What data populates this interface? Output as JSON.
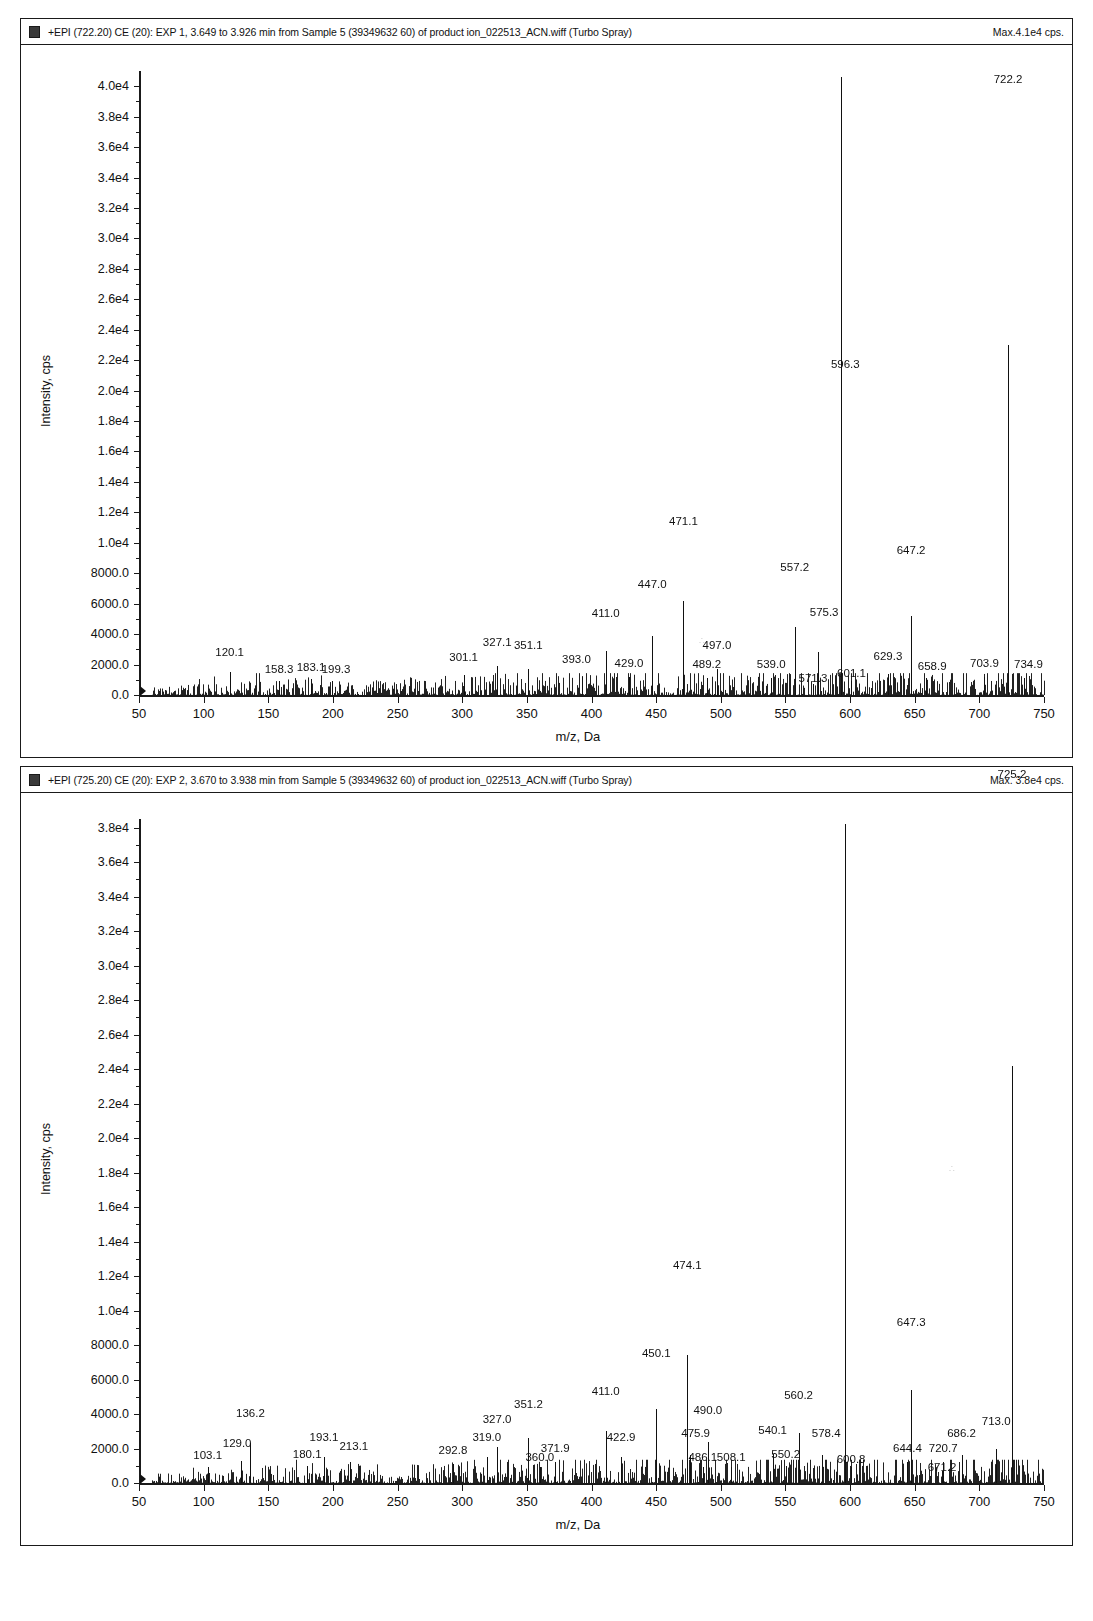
{
  "panels": [
    {
      "id": "top",
      "header": {
        "title": "+EPI (722.20) CE (20): EXP 1, 3.649 to 3.926 min from Sample 5 (39349632 60) of product ion_022513_ACN.wiff (Turbo Spray)",
        "max_label": "Max.4.1e4 cps."
      },
      "chart_data": {
        "type": "line",
        "title": "+EPI (722.20) CE (20): EXP 1, 3.649 to 3.926 min from Sample 5 (39349632 60) of product ion_022513_ACN.wiff (Turbo Spray)",
        "xlabel": "m/z, Da",
        "ylabel": "Intensity, cps",
        "xlim": [
          50,
          750
        ],
        "ylim": [
          0,
          41000
        ],
        "grid": false,
        "legend": "none",
        "xticks": [
          50,
          100,
          150,
          200,
          250,
          300,
          350,
          400,
          450,
          500,
          550,
          600,
          650,
          700,
          750
        ],
        "yticks": [
          0,
          2000,
          4000,
          6000,
          8000,
          10000,
          12000,
          14000,
          16000,
          18000,
          20000,
          22000,
          24000,
          26000,
          28000,
          30000,
          32000,
          34000,
          36000,
          38000,
          40000
        ],
        "ytick_labels": [
          "0.0",
          "2000.0",
          "4000.0",
          "6000.0",
          "8000.0",
          "1.0e4",
          "1.2e4",
          "1.4e4",
          "1.6e4",
          "1.8e4",
          "2.0e4",
          "2.2e4",
          "2.4e4",
          "2.6e4",
          "2.8e4",
          "3.0e4",
          "3.2e4",
          "3.4e4",
          "3.6e4",
          "3.8e4",
          "4.0e4"
        ],
        "peaks": [
          {
            "mz": 120.1,
            "intensity": 1500,
            "label": "120.1",
            "label_dx": 0,
            "label_dy": -12
          },
          {
            "mz": 158.3,
            "intensity": 900,
            "label": "158.3",
            "label_dx": 0,
            "label_dy": -4
          },
          {
            "mz": 183.1,
            "intensity": 1050,
            "label": "183.1",
            "label_dx": 0,
            "label_dy": -4
          },
          {
            "mz": 199.3,
            "intensity": 900,
            "label": "199.3",
            "label_dx": 4,
            "label_dy": -4
          },
          {
            "mz": 301.1,
            "intensity": 1300,
            "label": "301.1",
            "label_dx": 0,
            "label_dy": -10
          },
          {
            "mz": 327.1,
            "intensity": 1900,
            "label": "327.1",
            "label_dx": 0,
            "label_dy": -16
          },
          {
            "mz": 351.1,
            "intensity": 1700,
            "label": "351.1",
            "label_dx": 0,
            "label_dy": -16
          },
          {
            "mz": 393.0,
            "intensity": 1200,
            "label": "393.0",
            "label_dx": -6,
            "label_dy": -10
          },
          {
            "mz": 411.0,
            "intensity": 2900,
            "label": "411.0",
            "label_dx": 0,
            "label_dy": -30
          },
          {
            "mz": 429.0,
            "intensity": 1150,
            "label": "429.0",
            "label_dx": 0,
            "label_dy": -6
          },
          {
            "mz": 447.0,
            "intensity": 3900,
            "label": "447.0",
            "label_dx": 0,
            "label_dy": -44
          },
          {
            "mz": 471.1,
            "intensity": 6200,
            "label": "471.1",
            "label_dx": 0,
            "label_dy": -72
          },
          {
            "mz": 489.2,
            "intensity": 1100,
            "label": "489.2",
            "label_dx": 0,
            "label_dy": -6
          },
          {
            "mz": 497.0,
            "intensity": 1700,
            "label": "497.0",
            "label_dx": 0,
            "label_dy": -16
          },
          {
            "mz": 539.0,
            "intensity": 1100,
            "label": "539.0",
            "label_dx": 0,
            "label_dy": -6
          },
          {
            "mz": 557.2,
            "intensity": 4500,
            "label": "557.2",
            "label_dx": 0,
            "label_dy": -52
          },
          {
            "mz": 571.3,
            "intensity": 700,
            "label": "571.3",
            "label_dx": 0,
            "label_dy": 2
          },
          {
            "mz": 575.3,
            "intensity": 2800,
            "label": "575.3",
            "label_dx": 6,
            "label_dy": -32
          },
          {
            "mz": 593.2,
            "intensity": 40600,
            "label": "593.2",
            "label_dx": 0,
            "label_dy": -466
          },
          {
            "mz": 601.1,
            "intensity": 900,
            "label": "601.1",
            "label_dx": 0,
            "label_dy": 0
          },
          {
            "mz": 629.3,
            "intensity": 1400,
            "label": "629.3",
            "label_dx": 0,
            "label_dy": -10
          },
          {
            "mz": 647.2,
            "intensity": 5200,
            "label": "647.2",
            "label_dx": 0,
            "label_dy": -58
          },
          {
            "mz": 658.9,
            "intensity": 1100,
            "label": "658.9",
            "label_dx": 6,
            "label_dy": -4
          },
          {
            "mz": 703.9,
            "intensity": 1200,
            "label": "703.9",
            "label_dx": 0,
            "label_dy": -6
          },
          {
            "mz": 722.2,
            "intensity": 23000,
            "label": "722.2",
            "label_dx": 0,
            "label_dy": -258
          },
          {
            "mz": 734.9,
            "intensity": 1100,
            "label": "734.9",
            "label_dx": 4,
            "label_dy": -6
          }
        ]
      }
    },
    {
      "id": "bottom",
      "header": {
        "title": "+EPI (725.20) CE (20): EXP 2, 3.670 to 3.938 min from Sample 5 (39349632 60) of product ion_022513_ACN.wiff (Turbo Spray)",
        "max_label": "Max. 3.8e4 cps."
      },
      "chart_data": {
        "type": "line",
        "title": "+EPI (725.20) CE (20): EXP 2, 3.670 to 3.938 min from Sample 5 (39349632 60) of product ion_022513_ACN.wiff (Turbo Spray)",
        "xlabel": "m/z, Da",
        "ylabel": "Intensity, cps",
        "xlim": [
          50,
          750
        ],
        "ylim": [
          0,
          38500
        ],
        "grid": false,
        "legend": "none",
        "xticks": [
          50,
          100,
          150,
          200,
          250,
          300,
          350,
          400,
          450,
          500,
          550,
          600,
          650,
          700,
          750
        ],
        "yticks": [
          0,
          2000,
          4000,
          6000,
          8000,
          10000,
          12000,
          14000,
          16000,
          18000,
          20000,
          22000,
          24000,
          26000,
          28000,
          30000,
          32000,
          34000,
          36000,
          38000
        ],
        "ytick_labels": [
          "0.0",
          "2000.0",
          "4000.0",
          "6000.0",
          "8000.0",
          "1.0e4",
          "1.2e4",
          "1.4e4",
          "1.6e4",
          "1.8e4",
          "2.0e4",
          "2.2e4",
          "2.4e4",
          "2.6e4",
          "2.8e4",
          "3.0e4",
          "3.2e4",
          "3.4e4",
          "3.6e4",
          "3.8e4"
        ],
        "peaks": [
          {
            "mz": 103.1,
            "intensity": 900,
            "label": "103.1",
            "label_dx": 0,
            "label_dy": -4
          },
          {
            "mz": 129.0,
            "intensity": 1300,
            "label": "129.0",
            "label_dx": -4,
            "label_dy": -10
          },
          {
            "mz": 136.2,
            "intensity": 2300,
            "label": "136.2",
            "label_dx": 0,
            "label_dy": -22
          },
          {
            "mz": 180.1,
            "intensity": 1000,
            "label": "180.1",
            "label_dx": 0,
            "label_dy": -4
          },
          {
            "mz": 193.1,
            "intensity": 1500,
            "label": "193.1",
            "label_dx": 0,
            "label_dy": -12
          },
          {
            "mz": 213.1,
            "intensity": 1200,
            "label": "213.1",
            "label_dx": 4,
            "label_dy": -8
          },
          {
            "mz": 292.8,
            "intensity": 1100,
            "label": "292.8",
            "label_dx": 0,
            "label_dy": -6
          },
          {
            "mz": 319.0,
            "intensity": 1500,
            "label": "319.0",
            "label_dx": 0,
            "label_dy": -12
          },
          {
            "mz": 327.0,
            "intensity": 2100,
            "label": "327.0",
            "label_dx": 0,
            "label_dy": -20
          },
          {
            "mz": 351.2,
            "intensity": 2600,
            "label": "351.2",
            "label_dx": 0,
            "label_dy": -26
          },
          {
            "mz": 360.0,
            "intensity": 900,
            "label": "360.0",
            "label_dx": 0,
            "label_dy": -2
          },
          {
            "mz": 371.9,
            "intensity": 1200,
            "label": "371.9",
            "label_dx": 0,
            "label_dy": -6
          },
          {
            "mz": 411.0,
            "intensity": 3000,
            "label": "411.0",
            "label_dx": 0,
            "label_dy": -32
          },
          {
            "mz": 422.9,
            "intensity": 1500,
            "label": "422.9",
            "label_dx": 0,
            "label_dy": -12
          },
          {
            "mz": 450.1,
            "intensity": 4300,
            "label": "450.1",
            "label_dx": 0,
            "label_dy": -48
          },
          {
            "mz": 474.1,
            "intensity": 7400,
            "label": "474.1",
            "label_dx": 0,
            "label_dy": -82
          },
          {
            "mz": 475.9,
            "intensity": 1600,
            "label": "475.9",
            "label_dx": 6,
            "label_dy": -14
          },
          {
            "mz": 486.1,
            "intensity": 900,
            "label": "486.1",
            "label_dx": 0,
            "label_dy": -2
          },
          {
            "mz": 490.0,
            "intensity": 2400,
            "label": "490.0",
            "label_dx": 0,
            "label_dy": -24
          },
          {
            "mz": 508.1,
            "intensity": 900,
            "label": "508.1",
            "label_dx": 0,
            "label_dy": -2
          },
          {
            "mz": 540.1,
            "intensity": 1700,
            "label": "540.1",
            "label_dx": 0,
            "label_dy": -16
          },
          {
            "mz": 550.2,
            "intensity": 1000,
            "label": "550.2",
            "label_dx": 0,
            "label_dy": -4
          },
          {
            "mz": 560.2,
            "intensity": 2900,
            "label": "560.2",
            "label_dx": 0,
            "label_dy": -30
          },
          {
            "mz": 578.4,
            "intensity": 1600,
            "label": "578.4",
            "label_dx": 4,
            "label_dy": -14
          },
          {
            "mz": 596.3,
            "intensity": 38200,
            "label": "596.3",
            "label_dx": 0,
            "label_dy": -452
          },
          {
            "mz": 600.8,
            "intensity": 900,
            "label": "600.8",
            "label_dx": 0,
            "label_dy": 0
          },
          {
            "mz": 644.4,
            "intensity": 1200,
            "label": "644.4",
            "label_dx": 0,
            "label_dy": -6
          },
          {
            "mz": 647.3,
            "intensity": 5400,
            "label": "647.3",
            "label_dx": 0,
            "label_dy": -60
          },
          {
            "mz": 672.0,
            "intensity": 1200,
            "label": "720.7",
            "label_dx": 0,
            "label_dy": -6
          },
          {
            "mz": 686.2,
            "intensity": 1600,
            "label": "686.2",
            "label_dx": 0,
            "label_dy": -14
          },
          {
            "mz": 671.2,
            "intensity": 700,
            "label": "671.2",
            "label_dx": 0,
            "label_dy": 4
          },
          {
            "mz": 713.0,
            "intensity": 2000,
            "label": "713.0",
            "label_dx": 0,
            "label_dy": -20
          },
          {
            "mz": 725.2,
            "intensity": 24200,
            "label": "725.2",
            "label_dx": 0,
            "label_dy": -284
          }
        ]
      }
    }
  ]
}
